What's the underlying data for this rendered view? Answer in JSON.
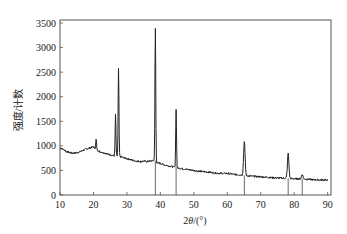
{
  "chart_data": {
    "type": "line",
    "title": "",
    "xlabel": "2θ/(°)",
    "ylabel": "强度/计数",
    "xlim": [
      10,
      91
    ],
    "ylim": [
      0,
      3500
    ],
    "xticks": [
      10,
      20,
      30,
      40,
      50,
      60,
      70,
      80,
      90
    ],
    "yticks": [
      0,
      500,
      1000,
      1500,
      2000,
      2500,
      3000,
      3500
    ],
    "grid": false,
    "legend": null,
    "series": [
      {
        "name": "XRD pattern",
        "color": "#222222",
        "baseline": [
          [
            10,
            960
          ],
          [
            11,
            930
          ],
          [
            12,
            880
          ],
          [
            13,
            860
          ],
          [
            14,
            850
          ],
          [
            15,
            860
          ],
          [
            16,
            880
          ],
          [
            17,
            910
          ],
          [
            18,
            940
          ],
          [
            19,
            960
          ],
          [
            20,
            980
          ],
          [
            21,
            920
          ],
          [
            22,
            880
          ],
          [
            23,
            860
          ],
          [
            24,
            840
          ],
          [
            25,
            820
          ],
          [
            26,
            800
          ],
          [
            27,
            790
          ],
          [
            28,
            780
          ],
          [
            29,
            760
          ],
          [
            30,
            740
          ],
          [
            31,
            720
          ],
          [
            32,
            700
          ],
          [
            33,
            690
          ],
          [
            34,
            680
          ],
          [
            35,
            690
          ],
          [
            36,
            680
          ],
          [
            37,
            690
          ],
          [
            38,
            700
          ],
          [
            39,
            660
          ],
          [
            40,
            640
          ],
          [
            42,
            600
          ],
          [
            44,
            570
          ],
          [
            46,
            540
          ],
          [
            48,
            520
          ],
          [
            50,
            500
          ],
          [
            52,
            480
          ],
          [
            54,
            470
          ],
          [
            56,
            450
          ],
          [
            58,
            440
          ],
          [
            60,
            440
          ],
          [
            62,
            420
          ],
          [
            64,
            410
          ],
          [
            66,
            390
          ],
          [
            68,
            380
          ],
          [
            70,
            370
          ],
          [
            72,
            360
          ],
          [
            74,
            350
          ],
          [
            76,
            345
          ],
          [
            78,
            340
          ],
          [
            80,
            330
          ],
          [
            82,
            330
          ],
          [
            84,
            320
          ],
          [
            86,
            310
          ],
          [
            88,
            310
          ],
          [
            90,
            300
          ]
        ],
        "peaks": [
          {
            "x": 20.8,
            "y": 1130
          },
          {
            "x": 26.6,
            "y": 1630
          },
          {
            "x": 27.5,
            "y": 2560
          },
          {
            "x": 38.5,
            "y": 3380
          },
          {
            "x": 44.7,
            "y": 1760
          },
          {
            "x": 65.1,
            "y": 1080
          },
          {
            "x": 78.2,
            "y": 840
          },
          {
            "x": 82.4,
            "y": 420
          }
        ]
      }
    ],
    "reference_lines": [
      {
        "x": 38.5,
        "y_top": 700
      },
      {
        "x": 44.7,
        "y_top": 600
      },
      {
        "x": 65.1,
        "y_top": 400
      },
      {
        "x": 78.2,
        "y_top": 340
      },
      {
        "x": 82.4,
        "y_top": 330
      }
    ],
    "annotations": []
  }
}
